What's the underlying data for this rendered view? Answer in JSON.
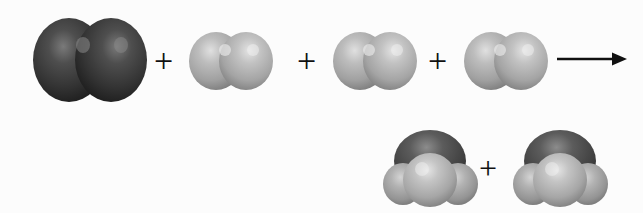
{
  "figure": {
    "kind": "molecular-reaction-space-filling-diagram",
    "background_color": "#fcfcfc",
    "equation_text": "N2 + H2 + H2 + H2 -> NH3 + NH3",
    "operators": {
      "plus": "+",
      "arrow": "⟶"
    }
  },
  "palette": {
    "dark_atom_base": "#3a3a3a",
    "dark_atom_shadow": "#1e1e1e",
    "dark_atom_highlight": "#6e6e6e",
    "light_atom_base": "#aeaeae",
    "light_atom_shadow": "#7d7d7d",
    "light_atom_highlight": "#d8d8d8",
    "mid_atom_base": "#606060",
    "outline": "#101010"
  },
  "reactants": {
    "label": "reactants",
    "items": [
      {
        "id": "r1",
        "name": "nitrogen-molecule",
        "formula": "N2",
        "atom_count": 2,
        "atom_color": "dark",
        "shape": "diatomic-horizontal",
        "x": 33,
        "y": 17,
        "width": 114,
        "height": 86
      },
      {
        "id": "r2",
        "name": "hydrogen-molecule",
        "formula": "H2",
        "atom_count": 2,
        "atom_color": "light",
        "shape": "diatomic-horizontal",
        "x": 189,
        "y": 31,
        "width": 84,
        "height": 60
      },
      {
        "id": "r3",
        "name": "hydrogen-molecule",
        "formula": "H2",
        "atom_count": 2,
        "atom_color": "light",
        "shape": "diatomic-horizontal",
        "x": 333,
        "y": 31,
        "width": 84,
        "height": 60
      },
      {
        "id": "r4",
        "name": "hydrogen-molecule",
        "formula": "H2",
        "atom_count": 2,
        "atom_color": "light",
        "shape": "diatomic-horizontal",
        "x": 464,
        "y": 31,
        "width": 84,
        "height": 60
      }
    ],
    "plus_signs": [
      {
        "id": "p1",
        "x": 154,
        "y": 44
      },
      {
        "id": "p2",
        "x": 297,
        "y": 44
      },
      {
        "id": "p3",
        "x": 428,
        "y": 44
      }
    ],
    "arrow": {
      "id": "reaction-arrow",
      "x": 556,
      "y": 46,
      "width": 72,
      "height": 26,
      "direction": "right"
    }
  },
  "products": {
    "label": "products",
    "items": [
      {
        "id": "p1m",
        "name": "ammonia-molecule",
        "formula": "NH3",
        "atom_count": 4,
        "shape": "tetrahedral-cluster",
        "center_atom_color": "dark",
        "outer_atom_color": "light",
        "outer_atom_count": 3,
        "x": 382,
        "y": 127,
        "width": 96,
        "height": 82
      },
      {
        "id": "p2m",
        "name": "ammonia-molecule",
        "formula": "NH3",
        "atom_count": 4,
        "shape": "tetrahedral-cluster",
        "center_atom_color": "dark",
        "outer_atom_color": "light",
        "outer_atom_count": 3,
        "x": 512,
        "y": 127,
        "width": 96,
        "height": 82
      }
    ],
    "plus_signs": [
      {
        "id": "p4",
        "x": 479,
        "y": 152
      }
    ]
  }
}
